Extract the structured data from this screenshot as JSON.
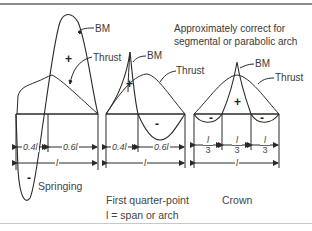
{
  "note": {
    "line1": "Approximately correct for",
    "line2": "segmental or parabolic arch"
  },
  "curve_labels": {
    "bm": "BM",
    "thrust": "Thrust"
  },
  "signs": {
    "plus": "+",
    "minus": "-"
  },
  "panels": [
    {
      "caption": "Springing",
      "dims": [
        "0.4l",
        "0.6l"
      ],
      "span": "l"
    },
    {
      "caption": "First quarter-point",
      "dims": [
        "0.4l",
        "0.6l"
      ],
      "span": "l"
    },
    {
      "caption": "Crown",
      "dims": [
        {
          "num": "l",
          "den": "3"
        },
        {
          "num": "l",
          "den": "3"
        },
        {
          "num": "l",
          "den": "3"
        }
      ],
      "span": "l"
    }
  ],
  "legend_note": "l = span or arch",
  "colors": {
    "line": "#2a2a2a",
    "rule": "#8a8a8a",
    "text": "#3a3a3a"
  }
}
